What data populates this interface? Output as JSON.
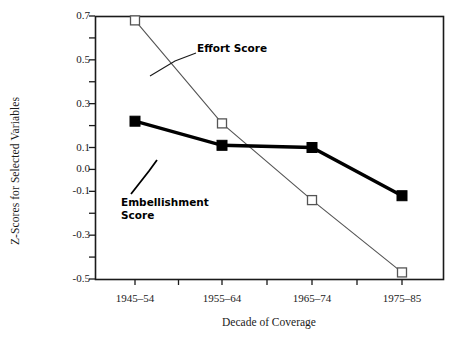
{
  "chart_data": {
    "type": "line",
    "title": "",
    "xlabel": "Decade of Coverage",
    "ylabel": "Z-Scores for Selected Variables",
    "categories": [
      "1945–54",
      "1955–64",
      "1965–74",
      "1975–85"
    ],
    "ylim": [
      -0.5,
      0.7
    ],
    "yticks": [
      0.7,
      0.6,
      0.5,
      0.4,
      0.3,
      0.2,
      0.1,
      0.0,
      -0.1,
      -0.2,
      -0.3,
      -0.4,
      -0.5
    ],
    "ytick_labels": [
      "0.7",
      "",
      "0.5",
      "",
      "0.3",
      "",
      "0.1",
      "0.0",
      "-0.1",
      "",
      "-0.3",
      "",
      "-0.5"
    ],
    "grid": false,
    "legend_position": "inline-annotations",
    "series": [
      {
        "name": "Effort Score",
        "marker": "open-square",
        "line_width": "thin",
        "values": [
          0.68,
          0.21,
          -0.14,
          -0.47
        ]
      },
      {
        "name": "Embellishment Score",
        "marker": "filled-square",
        "line_width": "thick",
        "values": [
          0.22,
          0.11,
          0.1,
          -0.12
        ]
      }
    ],
    "annotations": [
      {
        "text": "Effort Score",
        "lines": [
          "Effort Score"
        ]
      },
      {
        "text": "Embellishment Score",
        "lines": [
          "Embellishment",
          "Score"
        ]
      }
    ]
  },
  "colors": {
    "axis": "#1a1a1a",
    "effort_line": "#555555",
    "effort_marker_fill": "#ffffff",
    "embellishment_line": "#000000",
    "embellishment_marker_fill": "#000000",
    "background": "#ffffff"
  },
  "geometry": {
    "plot_left": 95,
    "plot_right": 443,
    "plot_top": 16,
    "plot_bottom": 279
  }
}
